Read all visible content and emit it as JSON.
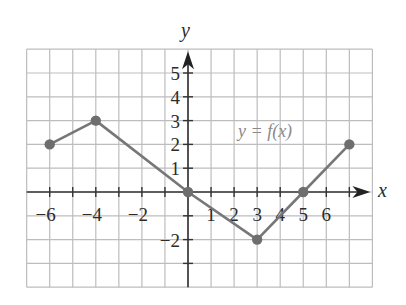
{
  "chart_data": {
    "type": "line",
    "title": "",
    "xlabel": "x",
    "ylabel": "y",
    "function_label": "y = f(x)",
    "xlim": [
      -7,
      8
    ],
    "ylim": [
      -4,
      6
    ],
    "grid": true,
    "x_tick_labels": [
      {
        "value": -6,
        "label": "−6"
      },
      {
        "value": -4,
        "label": "−4"
      },
      {
        "value": -2,
        "label": "−2"
      },
      {
        "value": 1,
        "label": "1"
      },
      {
        "value": 2,
        "label": "2"
      },
      {
        "value": 3,
        "label": "3"
      },
      {
        "value": 4,
        "label": "4"
      },
      {
        "value": 5,
        "label": "5"
      },
      {
        "value": 6,
        "label": "6"
      }
    ],
    "y_tick_labels": [
      {
        "value": 5,
        "label": "5"
      },
      {
        "value": 4,
        "label": "4"
      },
      {
        "value": 3,
        "label": "3"
      },
      {
        "value": 2,
        "label": "2"
      },
      {
        "value": 1,
        "label": "1"
      },
      {
        "value": -2,
        "label": "−2"
      }
    ],
    "series": [
      {
        "name": "f(x)",
        "points": [
          [
            -6,
            2
          ],
          [
            -4,
            3
          ],
          [
            0,
            0
          ],
          [
            3,
            -2
          ],
          [
            5,
            0
          ],
          [
            7,
            2
          ]
        ],
        "x": [
          -6,
          -4,
          0,
          3,
          5,
          7
        ],
        "values": [
          2,
          3,
          0,
          -2,
          0,
          2
        ]
      }
    ],
    "colors": {
      "grid": "#bdbdbd",
      "axis": "#333333",
      "line": "#777777",
      "dot": "#6e6e6e",
      "function_label": "#8a8a8a"
    }
  }
}
